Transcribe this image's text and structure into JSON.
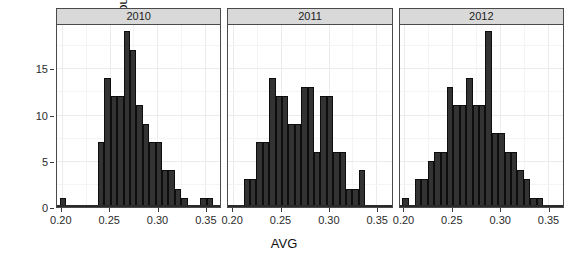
{
  "chart_data": {
    "type": "bar",
    "chart_style": "faceted histogram (ggplot2 facet_wrap)",
    "title": "",
    "xlabel": "AVG",
    "ylabel": "count",
    "xlim": [
      0.195,
      0.366
    ],
    "ylim": [
      0,
      19.8
    ],
    "grid": true,
    "legend": false,
    "legend_position": "none",
    "bin_width": 0.0067,
    "bar_color": "#333333",
    "bar_border_color": "#0d0d0d",
    "panel_strip_color": "#d9d9d9",
    "grid_color": "#ebebeb",
    "xticks": [
      0.2,
      0.25,
      0.3,
      0.35
    ],
    "xtick_labels": [
      "0.20",
      "0.25",
      "0.30",
      "0.35"
    ],
    "yticks": [
      0,
      5,
      10,
      15
    ],
    "ytick_labels": [
      "0",
      "5",
      "10",
      "15"
    ],
    "facet_variable": "year",
    "panels": [
      {
        "label": "2010",
        "bins": [
          {
            "x": 0.201,
            "count": 1
          },
          {
            "x": 0.2077,
            "count": 0
          },
          {
            "x": 0.2144,
            "count": 0
          },
          {
            "x": 0.2211,
            "count": 0
          },
          {
            "x": 0.2278,
            "count": 0
          },
          {
            "x": 0.2345,
            "count": 0
          },
          {
            "x": 0.2412,
            "count": 7
          },
          {
            "x": 0.2479,
            "count": 14
          },
          {
            "x": 0.2546,
            "count": 12
          },
          {
            "x": 0.2613,
            "count": 12
          },
          {
            "x": 0.268,
            "count": 19
          },
          {
            "x": 0.2747,
            "count": 17
          },
          {
            "x": 0.2814,
            "count": 11
          },
          {
            "x": 0.2881,
            "count": 9
          },
          {
            "x": 0.2948,
            "count": 7
          },
          {
            "x": 0.3015,
            "count": 7
          },
          {
            "x": 0.3082,
            "count": 4
          },
          {
            "x": 0.3149,
            "count": 4
          },
          {
            "x": 0.3216,
            "count": 2
          },
          {
            "x": 0.3283,
            "count": 1
          },
          {
            "x": 0.335,
            "count": 0
          },
          {
            "x": 0.3417,
            "count": 0
          },
          {
            "x": 0.3484,
            "count": 1
          },
          {
            "x": 0.3551,
            "count": 1
          }
        ]
      },
      {
        "label": "2011",
        "bins": [
          {
            "x": 0.201,
            "count": 0
          },
          {
            "x": 0.2077,
            "count": 0
          },
          {
            "x": 0.2144,
            "count": 3
          },
          {
            "x": 0.2211,
            "count": 3
          },
          {
            "x": 0.2278,
            "count": 7
          },
          {
            "x": 0.2345,
            "count": 7
          },
          {
            "x": 0.2412,
            "count": 14
          },
          {
            "x": 0.2479,
            "count": 12
          },
          {
            "x": 0.2546,
            "count": 12
          },
          {
            "x": 0.2613,
            "count": 9
          },
          {
            "x": 0.268,
            "count": 9
          },
          {
            "x": 0.2747,
            "count": 13
          },
          {
            "x": 0.2814,
            "count": 13
          },
          {
            "x": 0.2881,
            "count": 6
          },
          {
            "x": 0.2948,
            "count": 12
          },
          {
            "x": 0.3015,
            "count": 12
          },
          {
            "x": 0.3082,
            "count": 6
          },
          {
            "x": 0.3149,
            "count": 6
          },
          {
            "x": 0.3216,
            "count": 2
          },
          {
            "x": 0.3283,
            "count": 2
          },
          {
            "x": 0.335,
            "count": 4
          },
          {
            "x": 0.3417,
            "count": 0
          },
          {
            "x": 0.3484,
            "count": 0
          },
          {
            "x": 0.3551,
            "count": 0
          }
        ]
      },
      {
        "label": "2012",
        "bins": [
          {
            "x": 0.201,
            "count": 1
          },
          {
            "x": 0.2077,
            "count": 0
          },
          {
            "x": 0.2144,
            "count": 3
          },
          {
            "x": 0.2211,
            "count": 3
          },
          {
            "x": 0.2278,
            "count": 5
          },
          {
            "x": 0.2345,
            "count": 6
          },
          {
            "x": 0.2412,
            "count": 6
          },
          {
            "x": 0.2479,
            "count": 13
          },
          {
            "x": 0.2546,
            "count": 11
          },
          {
            "x": 0.2613,
            "count": 11
          },
          {
            "x": 0.268,
            "count": 14
          },
          {
            "x": 0.2747,
            "count": 11
          },
          {
            "x": 0.2814,
            "count": 11
          },
          {
            "x": 0.2881,
            "count": 19
          },
          {
            "x": 0.2948,
            "count": 8
          },
          {
            "x": 0.3015,
            "count": 8
          },
          {
            "x": 0.3082,
            "count": 6
          },
          {
            "x": 0.3149,
            "count": 6
          },
          {
            "x": 0.3216,
            "count": 4
          },
          {
            "x": 0.3283,
            "count": 3
          },
          {
            "x": 0.335,
            "count": 1
          },
          {
            "x": 0.3417,
            "count": 1
          },
          {
            "x": 0.3484,
            "count": 0
          },
          {
            "x": 0.3551,
            "count": 0
          }
        ]
      }
    ]
  }
}
